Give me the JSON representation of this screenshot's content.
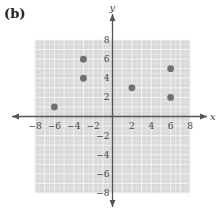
{
  "panel_label": "(b)",
  "chart_data": {
    "type": "scatter",
    "title": "",
    "xlabel": "x",
    "ylabel": "y",
    "xlim": [
      -8,
      8
    ],
    "ylim": [
      -8,
      8
    ],
    "grid": true,
    "x_ticks": [
      -8,
      -6,
      -4,
      -2,
      2,
      4,
      6,
      8
    ],
    "y_ticks": [
      8,
      6,
      4,
      2,
      -2,
      -4,
      -6,
      -8
    ],
    "x_tick_labels": [
      "−8",
      "−6",
      "−4",
      "−2",
      "2",
      "4",
      "6",
      "8"
    ],
    "y_tick_labels": [
      "8",
      "6",
      "4",
      "2",
      "−2",
      "−4",
      "−6",
      "−8"
    ],
    "points": [
      {
        "x": -6,
        "y": 1
      },
      {
        "x": -3,
        "y": 6
      },
      {
        "x": -3,
        "y": 4
      },
      {
        "x": 2,
        "y": 3
      },
      {
        "x": 6,
        "y": 5
      },
      {
        "x": 6,
        "y": 2
      }
    ],
    "colors": {
      "grid_background": "#d9d9d9",
      "grid_lines": "#f4f4f4",
      "axis": "#555555",
      "point": "#707070"
    }
  }
}
